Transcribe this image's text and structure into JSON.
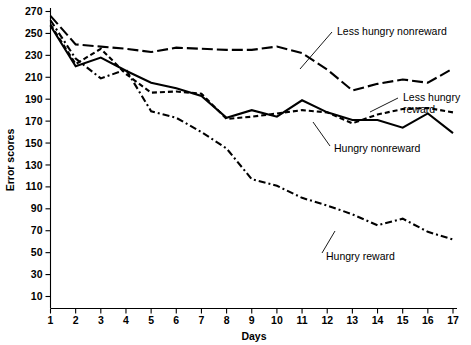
{
  "chart_data": {
    "type": "line",
    "title": "",
    "xlabel": "Days",
    "ylabel": "Error scores",
    "x": [
      1,
      2,
      3,
      4,
      5,
      6,
      7,
      8,
      9,
      10,
      11,
      12,
      13,
      14,
      15,
      16,
      17
    ],
    "xlim": [
      1,
      17
    ],
    "ylim": [
      0,
      278
    ],
    "yticks": [
      10,
      30,
      50,
      70,
      90,
      110,
      130,
      150,
      170,
      190,
      210,
      230,
      250,
      270
    ],
    "xticks": [
      1,
      2,
      3,
      4,
      5,
      6,
      7,
      8,
      9,
      10,
      11,
      12,
      13,
      14,
      15,
      16,
      17
    ],
    "grid": false,
    "legend_position": "inline-annotations",
    "series": [
      {
        "name": "Less hungry nonreward",
        "dash": "long-dash",
        "values": [
          266,
          240,
          238,
          236,
          233,
          237,
          236,
          235,
          235,
          238,
          232,
          217,
          198,
          204,
          208,
          205,
          218
        ]
      },
      {
        "name": "Less hungry reward",
        "dash": "short-dash",
        "values": [
          258,
          222,
          236,
          213,
          196,
          197,
          195,
          172,
          174,
          177,
          180,
          178,
          168,
          176,
          181,
          182,
          178
        ]
      },
      {
        "name": "Hungry nonreward",
        "dash": "solid",
        "values": [
          257,
          220,
          228,
          216,
          205,
          200,
          193,
          173,
          180,
          174,
          189,
          178,
          171,
          171,
          164,
          177,
          159
        ]
      },
      {
        "name": "Hungry reward",
        "dash": "dash-dot",
        "values": [
          262,
          227,
          209,
          217,
          179,
          173,
          160,
          145,
          117,
          111,
          100,
          93,
          85,
          75,
          81,
          69,
          62
        ]
      }
    ],
    "annotations": [
      {
        "text": "Less hungry nonreward",
        "series": "Less hungry nonreward",
        "anchor_day": 11
      },
      {
        "text": "Less hungry",
        "text_line2": "reward",
        "series": "Less hungry reward",
        "anchor_day": 15
      },
      {
        "text": "Hungry nonreward",
        "series": "Hungry nonreward",
        "anchor_day": 13
      },
      {
        "text": "Hungry reward",
        "series": "Hungry reward",
        "anchor_day": 13
      }
    ]
  },
  "axes": {
    "y_label": "Error scores",
    "x_label": "Days",
    "y_tick_labels": [
      "270",
      "250",
      "230",
      "210",
      "190",
      "170",
      "150",
      "130",
      "110",
      "90",
      "70",
      "50",
      "30",
      "10"
    ],
    "x_tick_labels": [
      "1",
      "2",
      "3",
      "4",
      "5",
      "6",
      "7",
      "8",
      "9",
      "10",
      "11",
      "12",
      "13",
      "14",
      "15",
      "16",
      "17"
    ]
  },
  "annotations": {
    "less_hungry_nonreward": "Less hungry nonreward",
    "less_hungry_reward_line1": "Less hungry",
    "less_hungry_reward_line2": "reward",
    "hungry_nonreward": "Hungry nonreward",
    "hungry_reward": "Hungry reward"
  },
  "colors": {
    "foreground": "#000000",
    "background": "#ffffff"
  }
}
